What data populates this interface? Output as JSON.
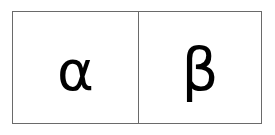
{
  "diagram": {
    "cells": [
      {
        "symbol": "α",
        "name": "alpha"
      },
      {
        "symbol": "β",
        "name": "beta"
      }
    ],
    "colors": {
      "border": "#6a6a6a",
      "text": "#000000",
      "background": "#ffffff"
    }
  }
}
